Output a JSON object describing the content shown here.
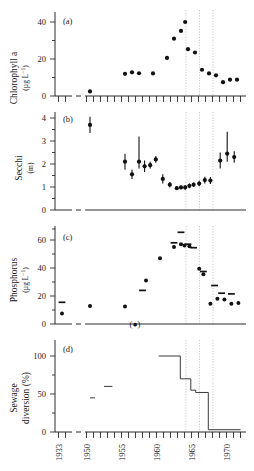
{
  "figure": {
    "type": "multi-panel-timeseries",
    "panels": [
      "a",
      "b",
      "c",
      "d"
    ],
    "x_axis": {
      "label": "",
      "tick_labels": [
        "1933",
        "1950",
        "1955",
        "1960",
        "1965",
        "1970"
      ],
      "tick_years": [
        1933,
        1950,
        1955,
        1960,
        1965,
        1970
      ],
      "minor_tick_interval_years": 1,
      "axis_break_between": [
        1933,
        1950
      ],
      "range_segment1": [
        1932,
        1934
      ],
      "range_segment2": [
        1949,
        1972
      ]
    },
    "event_lines": {
      "style": "dotted-vertical",
      "color": "#b9b9b9",
      "years": [
        1963,
        1965,
        1967
      ]
    },
    "panel_a": {
      "tag": "(a)",
      "ylabel_line1": "Chlorophyll a",
      "ylabel_line2": "(µg L",
      "ylabel_exp": "−1",
      "ylabel_line2_end": ")",
      "yticks": [
        0,
        20,
        40
      ],
      "ylim": [
        0,
        45
      ],
      "minor_tick_interval": 10
    },
    "panel_b": {
      "tag": "(b)",
      "ylabel_line1": "Secchi",
      "ylabel_line2": "(m)",
      "yticks": [
        0,
        1,
        2,
        3,
        4
      ],
      "ylim": [
        0,
        4.4
      ],
      "minor_tick_interval": 0.5
    },
    "panel_c": {
      "tag": "(c)",
      "ylabel_line1": "Phosphorus",
      "ylabel_line2": "(µg L",
      "ylabel_exp": "−1",
      "ylabel_line2_end": ")",
      "yticks": [
        0,
        20,
        40,
        60
      ],
      "ylim": [
        0,
        70
      ],
      "minor_tick_interval": 10,
      "annotation": "(●)"
    },
    "panel_d": {
      "tag": "(d)",
      "ylabel_line1": "Sewage",
      "ylabel_line2": "diversion (%)",
      "yticks": [
        0,
        50,
        100
      ],
      "ylim": [
        0,
        115
      ],
      "minor_tick_interval": 25
    }
  },
  "chart_data": [
    {
      "type": "scatter",
      "panel": "a",
      "title": "(a) Chlorophyll a",
      "xlabel": "",
      "ylabel": "Chlorophyll a (µg L−1)",
      "ylim": [
        0,
        45
      ],
      "yticks": [
        0,
        20,
        40
      ],
      "grid": false,
      "x": [
        1950,
        1955,
        1956,
        1957,
        1959,
        1961,
        1962,
        1963,
        1963.6,
        1964,
        1965,
        1966,
        1967,
        1968,
        1969,
        1970,
        1971
      ],
      "values": [
        2.5,
        12.0,
        12.8,
        12.3,
        12.2,
        20.6,
        31.0,
        35.2,
        40.0,
        25.3,
        23.5,
        14.2,
        12.2,
        11.2,
        7.5,
        8.8,
        8.8
      ]
    },
    {
      "type": "scatter",
      "panel": "b",
      "title": "(b) Secchi",
      "xlabel": "",
      "ylabel": "Secchi (m)",
      "ylim": [
        0,
        4.4
      ],
      "yticks": [
        0,
        1,
        2,
        3,
        4
      ],
      "grid": false,
      "errorbars": true,
      "x": [
        1950,
        1955,
        1956,
        1957,
        1957.8,
        1958.6,
        1959.4,
        1960.4,
        1961.4,
        1962.4,
        1963,
        1963.6,
        1964.2,
        1964.8,
        1965.6,
        1966.4,
        1967.2,
        1968.6,
        1969.6,
        1970.6
      ],
      "values": [
        3.7,
        2.1,
        1.55,
        2.1,
        1.9,
        1.95,
        2.2,
        1.35,
        1.1,
        0.95,
        0.98,
        0.98,
        1.05,
        1.1,
        1.15,
        1.3,
        1.28,
        2.15,
        2.45,
        2.3
      ],
      "err_low": [
        0.35,
        0.35,
        0.2,
        0.3,
        0.25,
        0.15,
        0.15,
        0.2,
        0.12,
        0.08,
        0.08,
        0.1,
        0.1,
        0.1,
        0.12,
        0.15,
        0.15,
        0.35,
        0.35,
        0.25
      ],
      "err_high": [
        0.35,
        0.35,
        0.2,
        1.1,
        0.25,
        0.15,
        0.15,
        0.2,
        0.12,
        0.08,
        0.08,
        0.1,
        0.1,
        0.1,
        0.12,
        0.15,
        0.15,
        0.35,
        0.95,
        0.25
      ]
    },
    {
      "type": "scatter",
      "panel": "c",
      "title": "(c) Phosphorus",
      "xlabel": "",
      "ylabel": "Phosphorus (µg L−1)",
      "ylim": [
        0,
        70
      ],
      "yticks": [
        0,
        20,
        40,
        60
      ],
      "grid": false,
      "series": [
        {
          "name": "points",
          "x": [
            1933,
            1950,
            1955,
            1957,
            1958,
            1960,
            1962,
            1963,
            1963.5,
            1964.2,
            1965.6,
            1966.2,
            1967.2,
            1968.2,
            1969.2,
            1970.2,
            1971.2
          ],
          "values": [
            7.5,
            12.8,
            12.5,
            0.5,
            31.0,
            47.0,
            55.0,
            57.0,
            56.0,
            55.5,
            39.5,
            35.5,
            14.5,
            18.0,
            17.5,
            14.5,
            15.0
          ]
        },
        {
          "name": "means-dashes",
          "x": [
            1933,
            1957.5,
            1962,
            1963,
            1964,
            1964.8,
            1966.2,
            1967.8,
            1968.8,
            1970.2
          ],
          "values": [
            15.5,
            24.0,
            58.0,
            65.5,
            57.0,
            54.5,
            37.5,
            27.5,
            22.0,
            21.5
          ]
        }
      ]
    },
    {
      "type": "line",
      "panel": "d",
      "title": "(d) Sewage diversion",
      "xlabel": "",
      "ylabel": "Sewage diversion (%)",
      "ylim": [
        0,
        115
      ],
      "yticks": [
        0,
        50,
        100
      ],
      "grid": false,
      "style": "step",
      "segments_isolated": [
        {
          "x": [
            1950,
            1950.7
          ],
          "y": 45
        },
        {
          "x": [
            1952,
            1953.2
          ],
          "y": 60
        }
      ],
      "step_x": [
        1959.8,
        1962.9,
        1962.9,
        1964.4,
        1964.4,
        1965.1,
        1965.1,
        1966.9,
        1966.9,
        1971.5
      ],
      "step_y": [
        100,
        100,
        70,
        70,
        55,
        55,
        52,
        52,
        3,
        3
      ]
    }
  ]
}
